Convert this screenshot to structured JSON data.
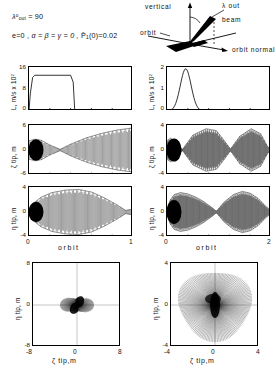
{
  "header": {
    "conditions": [
      {
        "id": "lambda-out",
        "text": "λ°out = 90"
      },
      {
        "id": "params",
        "text": "e=0,  α = β = γ = 0 ,  P̄1(0)=0.02"
      }
    ],
    "lambda_symbol": "λ",
    "lambda_sup": "o",
    "lambda_sub": "out",
    "lambda_value": "= 90",
    "e_term": "e=0 ,",
    "angles_term": "α = β = γ = 0 ,",
    "p_term": "(0)=0.02",
    "p_symbol": "P̄",
    "p_sub": "1"
  },
  "schematic": {
    "name": "beam-orbit-geometry",
    "labels": {
      "vertical": "vertical",
      "lambda_out": "λ out",
      "beam": "beam",
      "orbit": "orbit",
      "orbit_normal": "orbit  normal"
    }
  },
  "chart_data": [
    {
      "id": "L-left",
      "type": "line",
      "title": "",
      "xlabel": "",
      "ylabel": "L, m/s x 10²",
      "ylabel_parts": {
        "main": "L, m/s x 10",
        "sup": "2"
      },
      "xlim": [
        0,
        1
      ],
      "ylim": [
        0,
        16
      ],
      "yticks": [
        0,
        8,
        16
      ],
      "ytick_labels": [
        "0",
        "8",
        "16"
      ],
      "xticks": [
        0,
        0.2,
        0.4,
        0.6,
        0.8,
        1
      ],
      "xtick_labels": [
        "",
        "",
        "",
        "",
        "",
        ""
      ],
      "grid": false,
      "series": [
        {
          "name": "thrust-profile",
          "x": [
            0,
            0.012,
            0.035,
            0.055,
            0.4,
            0.425,
            0.44,
            1.0
          ],
          "y": [
            0,
            6.2,
            12.2,
            13.0,
            13.0,
            10.5,
            0,
            0
          ]
        }
      ]
    },
    {
      "id": "L-right",
      "type": "line",
      "title": "",
      "xlabel": "",
      "ylabel": "L, m/s x 10²",
      "ylabel_parts": {
        "main": "L, m/s x 10",
        "sup": "2"
      },
      "xlim": [
        0,
        2
      ],
      "ylim": [
        0,
        2
      ],
      "yticks": [
        0,
        1,
        2
      ],
      "ytick_labels": [
        "0",
        "1",
        "2"
      ],
      "xticks": [
        0,
        0.4,
        0.8,
        1.2,
        1.6,
        2.0
      ],
      "xtick_labels": [
        "",
        "",
        "",
        "",
        "",
        ""
      ],
      "grid": false,
      "series": [
        {
          "name": "thrust-pulse",
          "shape": "bell",
          "center": 0.36,
          "width": 0.3,
          "peak": 1.92
        }
      ]
    },
    {
      "id": "zeta-left",
      "type": "line",
      "xlabel": "",
      "ylabel": "ζ tip, m",
      "xlim": [
        0,
        1
      ],
      "ylim": [
        -6,
        6
      ],
      "yticks": [
        -6,
        0,
        6
      ],
      "ytick_labels": [
        "-6",
        "0",
        "6"
      ],
      "grid": false,
      "envelope": {
        "kind": "oscillation-growing",
        "cycles": 46,
        "nodes": [
          0.3
        ],
        "amp_profile": [
          [
            0.0,
            2.2
          ],
          [
            0.06,
            2.6
          ],
          [
            0.12,
            2.3
          ],
          [
            0.2,
            1.2
          ],
          [
            0.3,
            0.15
          ],
          [
            0.4,
            1.4
          ],
          [
            0.55,
            2.9
          ],
          [
            0.7,
            4.0
          ],
          [
            0.85,
            4.8
          ],
          [
            1.0,
            5.3
          ]
        ]
      }
    },
    {
      "id": "zeta-right",
      "type": "line",
      "xlabel": "",
      "ylabel": "ζ tip, m",
      "xlim": [
        0,
        2
      ],
      "ylim": [
        -4,
        4
      ],
      "yticks": [
        -4,
        0,
        4
      ],
      "ytick_labels": [
        "-4",
        "0",
        "4"
      ],
      "grid": false,
      "envelope": {
        "kind": "beat",
        "cycles": 95,
        "nodes": [
          0.3,
          1.22,
          1.95
        ],
        "amp_profile": [
          [
            0.0,
            1.5
          ],
          [
            0.07,
            1.9
          ],
          [
            0.16,
            1.2
          ],
          [
            0.3,
            0.1
          ],
          [
            0.5,
            2.4
          ],
          [
            0.75,
            3.4
          ],
          [
            0.95,
            3.1
          ],
          [
            1.1,
            1.5
          ],
          [
            1.22,
            0.12
          ],
          [
            1.4,
            2.2
          ],
          [
            1.62,
            3.4
          ],
          [
            1.8,
            2.6
          ],
          [
            1.95,
            0.3
          ],
          [
            2.0,
            0.9
          ]
        ]
      }
    },
    {
      "id": "eta-left",
      "type": "line",
      "xlabel": "orbit",
      "ylabel": "η tip, m",
      "xlim": [
        0,
        1
      ],
      "ylim": [
        -4,
        4
      ],
      "yticks": [
        -4,
        0,
        4
      ],
      "ytick_labels": [
        "-4",
        "0",
        "4"
      ],
      "xticks": [
        0,
        0.25,
        0.5,
        0.75,
        1
      ],
      "xtick_labels": [
        "0",
        "",
        "",
        "",
        "1"
      ],
      "grid": false,
      "envelope": {
        "kind": "lens",
        "cycles": 48,
        "nodes": [
          0.93
        ],
        "amp_profile": [
          [
            0.0,
            0.2
          ],
          [
            0.05,
            1.5
          ],
          [
            0.12,
            2.4
          ],
          [
            0.22,
            3.1
          ],
          [
            0.35,
            3.5
          ],
          [
            0.48,
            3.6
          ],
          [
            0.6,
            3.2
          ],
          [
            0.72,
            2.3
          ],
          [
            0.84,
            1.2
          ],
          [
            0.93,
            0.25
          ],
          [
            1.0,
            0.5
          ]
        ]
      }
    },
    {
      "id": "eta-right",
      "type": "line",
      "xlabel": "orbit",
      "ylabel": "η tip, m",
      "xlim": [
        0,
        2
      ],
      "ylim": [
        -4,
        4
      ],
      "yticks": [
        -4,
        0,
        4
      ],
      "ytick_labels": [
        "-4",
        "0",
        "4"
      ],
      "xticks": [
        0,
        0.5,
        1.0,
        1.5,
        2.0
      ],
      "xtick_labels": [
        "0",
        "",
        "",
        "",
        "2"
      ],
      "grid": false,
      "envelope": {
        "kind": "beat",
        "cycles": 96,
        "nodes": [
          0.95,
          1.98
        ],
        "amp_profile": [
          [
            0.0,
            0.25
          ],
          [
            0.06,
            1.9
          ],
          [
            0.14,
            2.8
          ],
          [
            0.26,
            3.1
          ],
          [
            0.4,
            2.9
          ],
          [
            0.55,
            2.4
          ],
          [
            0.7,
            1.7
          ],
          [
            0.85,
            0.8
          ],
          [
            0.95,
            0.12
          ],
          [
            1.1,
            1.6
          ],
          [
            1.28,
            2.8
          ],
          [
            1.45,
            3.3
          ],
          [
            1.6,
            3.0
          ],
          [
            1.75,
            2.2
          ],
          [
            1.9,
            0.9
          ],
          [
            2.0,
            0.2
          ]
        ]
      }
    },
    {
      "id": "phase-left",
      "type": "scatter",
      "xlabel": "ζ tip,m",
      "ylabel": "η tip, m",
      "xlim": [
        -8,
        8
      ],
      "ylim": [
        -8,
        8
      ],
      "xticks": [
        -8,
        0,
        8
      ],
      "xtick_labels": [
        "-8",
        "0",
        "8"
      ],
      "yticks": [
        -8,
        0,
        8
      ],
      "ytick_labels": [
        "-8",
        "0",
        "8"
      ],
      "grid": true,
      "pattern": {
        "kind": "rosette-s",
        "rays": 150,
        "rmax": 3.6,
        "lobe": 2
      }
    },
    {
      "id": "phase-right",
      "type": "scatter",
      "xlabel": "ζ tip,m",
      "ylabel": "η tip, m",
      "xlim": [
        -4,
        4
      ],
      "ylim": [
        -4,
        4
      ],
      "xticks": [
        -4,
        0,
        4
      ],
      "xtick_labels": [
        "-4",
        "0",
        "4"
      ],
      "yticks": [
        -4,
        0,
        4
      ],
      "ytick_labels": [
        "-4",
        "0",
        "4"
      ],
      "grid": true,
      "pattern": {
        "kind": "starburst",
        "rays": 150,
        "rmax": 3.55,
        "lobe": 1
      }
    }
  ]
}
